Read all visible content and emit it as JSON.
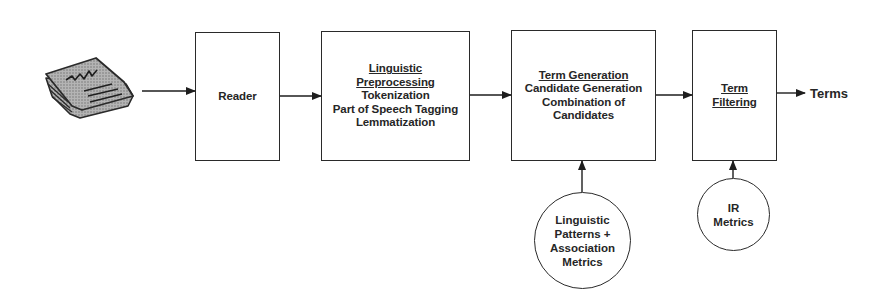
{
  "diagram": {
    "type": "flowchart",
    "input_icon": "newspaper-icon",
    "nodes": [
      {
        "id": "reader",
        "shape": "box",
        "title": "",
        "lines": [
          "Reader"
        ]
      },
      {
        "id": "linguistic-preprocessing",
        "shape": "box",
        "title": "Linguistic Preprocessing",
        "title_lines": [
          "Linguistic",
          "Preprocessing"
        ],
        "lines": [
          "Tokenization",
          "Part of Speech Tagging",
          "Lemmatization"
        ]
      },
      {
        "id": "term-generation",
        "shape": "box",
        "title": "Term Generation",
        "title_lines": [
          "Term Generation"
        ],
        "lines": [
          "Candidate Generation",
          "Combination of",
          "Candidates"
        ]
      },
      {
        "id": "term-filtering",
        "shape": "box",
        "title": "Term Filtering",
        "title_lines": [
          "Term",
          "Filtering"
        ],
        "lines": []
      },
      {
        "id": "linguistic-patterns",
        "shape": "circle",
        "lines": [
          "Linguistic",
          "Patterns +",
          "Association",
          "Metrics"
        ]
      },
      {
        "id": "ir-metrics",
        "shape": "circle",
        "lines": [
          "IR",
          "Metrics"
        ]
      }
    ],
    "output_label": "Terms",
    "edges": [
      {
        "from": "newspaper-icon",
        "to": "reader"
      },
      {
        "from": "reader",
        "to": "linguistic-preprocessing"
      },
      {
        "from": "linguistic-preprocessing",
        "to": "term-generation"
      },
      {
        "from": "term-generation",
        "to": "term-filtering"
      },
      {
        "from": "term-filtering",
        "to": "Terms"
      },
      {
        "from": "linguistic-patterns",
        "to": "term-generation"
      },
      {
        "from": "ir-metrics",
        "to": "term-filtering"
      }
    ]
  },
  "colors": {
    "ink": "#2a2a2a",
    "icon_fill": "#9a9a9a",
    "background": "#ffffff"
  }
}
